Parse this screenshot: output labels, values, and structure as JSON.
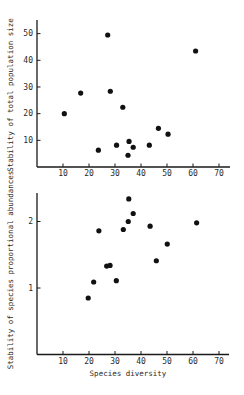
{
  "chart_data": [
    {
      "type": "scatter",
      "title": "",
      "xlabel": "",
      "ylabel": "Stability of total population size",
      "xlim": [
        0,
        74
      ],
      "ylim": [
        0,
        54
      ],
      "xticks": [
        10,
        20,
        30,
        40,
        50,
        60,
        70
      ],
      "yticks": [
        10,
        20,
        30,
        40,
        50
      ],
      "grid": false,
      "legend": null,
      "points": [
        {
          "x": 10.5,
          "y": 20.0
        },
        {
          "x": 16.8,
          "y": 27.7
        },
        {
          "x": 23.6,
          "y": 6.3
        },
        {
          "x": 27.2,
          "y": 49.5
        },
        {
          "x": 28.2,
          "y": 28.4
        },
        {
          "x": 30.6,
          "y": 8.2
        },
        {
          "x": 33.0,
          "y": 22.4
        },
        {
          "x": 35.0,
          "y": 4.4
        },
        {
          "x": 35.4,
          "y": 9.6
        },
        {
          "x": 37.0,
          "y": 7.4
        },
        {
          "x": 43.2,
          "y": 8.2
        },
        {
          "x": 46.7,
          "y": 14.5
        },
        {
          "x": 50.4,
          "y": 12.3
        },
        {
          "x": 61.0,
          "y": 43.5
        }
      ]
    },
    {
      "type": "scatter",
      "title": "",
      "xlabel": "Species diversity",
      "ylabel": "Stability of species proportional abundances",
      "xlim": [
        0,
        74
      ],
      "ylim": [
        0,
        2.45
      ],
      "xticks": [
        10,
        20,
        30,
        40,
        50,
        60,
        70
      ],
      "yticks": [
        1,
        2
      ],
      "grid": false,
      "legend": null,
      "points": [
        {
          "x": 19.7,
          "y": 0.85
        },
        {
          "x": 21.8,
          "y": 1.09
        },
        {
          "x": 23.8,
          "y": 1.86
        },
        {
          "x": 26.8,
          "y": 1.33
        },
        {
          "x": 28.1,
          "y": 1.34
        },
        {
          "x": 30.5,
          "y": 1.11
        },
        {
          "x": 33.2,
          "y": 1.88
        },
        {
          "x": 35.1,
          "y": 2.0
        },
        {
          "x": 35.3,
          "y": 2.34
        },
        {
          "x": 37.0,
          "y": 2.12
        },
        {
          "x": 43.5,
          "y": 1.93
        },
        {
          "x": 45.9,
          "y": 1.41
        },
        {
          "x": 50.1,
          "y": 1.66
        },
        {
          "x": 61.4,
          "y": 1.98
        }
      ]
    }
  ],
  "colors": {
    "background": "#ffffff",
    "ink": "#111111"
  }
}
